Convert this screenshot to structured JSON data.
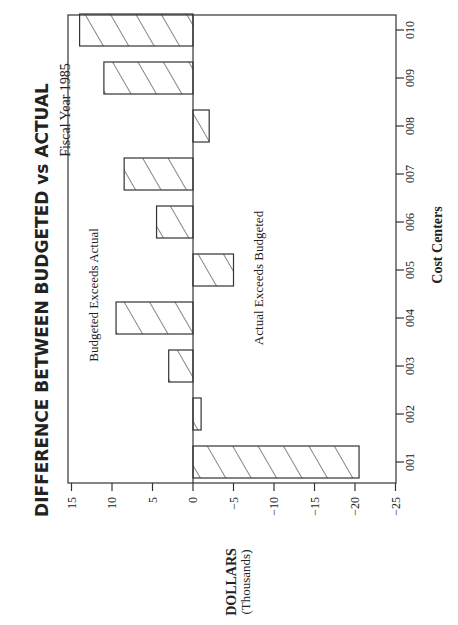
{
  "chart_data": {
    "type": "bar",
    "orientation": "horizontal-rotated-page",
    "title": "DIFFERENCE BETWEEN BUDGETED vs ACTUAL",
    "subtitle": "Fiscal Year 1985",
    "xlabel": "Cost Centers",
    "ylabel": "DOLLARS",
    "ylabel_sub": "(Thousands)",
    "categories": [
      "001",
      "002",
      "003",
      "004",
      "005",
      "006",
      "007",
      "008",
      "009",
      "010"
    ],
    "values": [
      -20.5,
      -1,
      3,
      9.5,
      -5,
      4.5,
      8.5,
      -2,
      11,
      14
    ],
    "ylim": [
      -25,
      15
    ],
    "yticks": [
      15,
      10,
      5,
      0,
      -5,
      -10,
      -15,
      -20,
      -25
    ],
    "ytick_labels": [
      "15",
      "10",
      "5",
      "0",
      "−5",
      "−10",
      "−15",
      "−20",
      "−25"
    ],
    "annotations": [
      {
        "text": "Budgeted Exceeds Actual",
        "region": "positive"
      },
      {
        "text": "Actual Exceeds Budgeted",
        "region": "negative"
      }
    ],
    "bar_fill": "diagonal-hatch",
    "grid": false,
    "legend": null
  },
  "colors": {
    "ink": "#333333",
    "background": "#ffffff"
  }
}
